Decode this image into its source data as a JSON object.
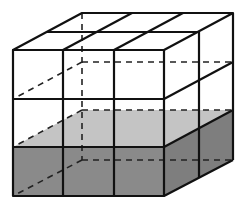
{
  "diagram": {
    "grid": {
      "rows": 3,
      "columns": 3,
      "depth": 2
    },
    "colors": {
      "edge": "#111111",
      "dark_fill": "#8a8a8a",
      "light_fill": "#c4c4c4",
      "background": "#ffffff"
    }
  }
}
